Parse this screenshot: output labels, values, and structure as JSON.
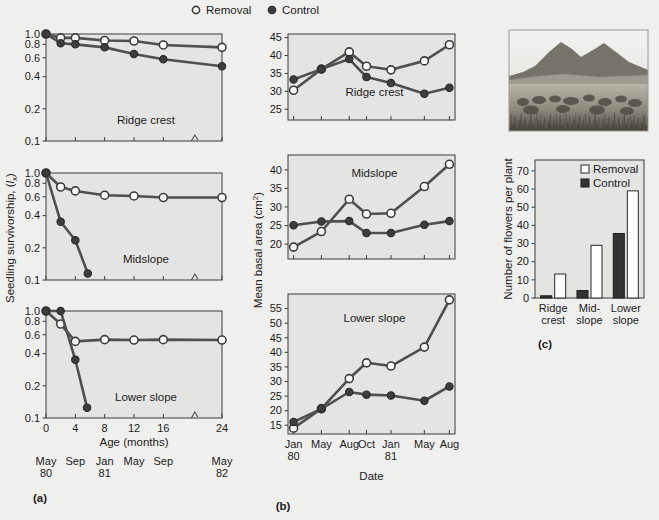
{
  "figure": {
    "legend": [
      {
        "label": "Removal",
        "marker": "open-circle"
      },
      {
        "label": "Control",
        "marker": "filled-circle"
      }
    ],
    "panel_letters": {
      "a": "(a)",
      "b": "(b)",
      "c": "(c)"
    }
  },
  "panel_a": {
    "ylabel": "Seedling survivorship, (lx)",
    "xlabel": "Age (months)",
    "yticks": [
      "1.0",
      "0.8",
      "0.6",
      "0.4",
      "0.2",
      "0.1"
    ],
    "ytickvals": [
      1.0,
      0.8,
      0.6,
      0.4,
      0.2,
      0.1
    ],
    "ylim": [
      0.1,
      1.0
    ],
    "yscale": "log",
    "xticks": [
      "0",
      "4",
      "8",
      "12",
      "16",
      "24"
    ],
    "xtickvals": [
      0,
      4,
      8,
      12,
      16,
      24
    ],
    "xlim": [
      0,
      24
    ],
    "axis_break_at": 20,
    "date_labels": [
      {
        "line1": "May",
        "line2": "80",
        "x": 0
      },
      {
        "line1": "Sep",
        "line2": "",
        "x": 4
      },
      {
        "line1": "Jan",
        "line2": "81",
        "x": 8
      },
      {
        "line1": "May",
        "line2": "",
        "x": 12
      },
      {
        "line1": "Sep",
        "line2": "",
        "x": 16
      },
      {
        "line1": "May",
        "line2": "82",
        "x": 24
      }
    ],
    "subplots": [
      {
        "title": "Ridge crest",
        "series": [
          {
            "name": "Removal",
            "marker": "open-circle",
            "x": [
              0,
              2,
              4,
              8,
              12,
              16,
              24
            ],
            "y": [
              1.0,
              0.92,
              0.92,
              0.87,
              0.86,
              0.79,
              0.75
            ]
          },
          {
            "name": "Control",
            "marker": "filled-circle",
            "x": [
              0,
              2,
              4,
              8,
              12,
              16,
              24
            ],
            "y": [
              1.0,
              0.82,
              0.8,
              0.75,
              0.65,
              0.58,
              0.5
            ]
          }
        ]
      },
      {
        "title": "Midslope",
        "series": [
          {
            "name": "Removal",
            "marker": "open-circle",
            "x": [
              0,
              2,
              4,
              8,
              12,
              16,
              24
            ],
            "y": [
              1.0,
              0.74,
              0.68,
              0.62,
              0.61,
              0.59,
              0.59
            ]
          },
          {
            "name": "Control",
            "marker": "filled-circle",
            "x": [
              0,
              2,
              4,
              5.7
            ],
            "y": [
              1.0,
              0.35,
              0.235,
              0.115
            ]
          }
        ]
      },
      {
        "title": "Lower slope",
        "series": [
          {
            "name": "Removal",
            "marker": "open-circle",
            "x": [
              0,
              2,
              4,
              8,
              12,
              16,
              24
            ],
            "y": [
              1.0,
              0.755,
              0.52,
              0.54,
              0.535,
              0.54,
              0.535
            ]
          },
          {
            "name": "Control",
            "marker": "filled-circle",
            "x": [
              0,
              2,
              4,
              5.6
            ],
            "y": [
              1.0,
              1.0,
              0.35,
              0.125
            ]
          }
        ]
      }
    ]
  },
  "panel_b": {
    "ylabel": "Mean basal area (cm2)",
    "xlabel": "Date",
    "xticks": [
      {
        "line1": "Jan",
        "line2": "80",
        "x": 0
      },
      {
        "line1": "May",
        "line2": "",
        "x": 1
      },
      {
        "line1": "Aug",
        "line2": "",
        "x": 2
      },
      {
        "line1": "Oct",
        "line2": "",
        "x": 2.62
      },
      {
        "line1": "Jan",
        "line2": "81",
        "x": 3.5
      },
      {
        "line1": "May",
        "line2": "",
        "x": 4.7
      },
      {
        "line1": "Aug",
        "line2": "",
        "x": 5.6
      }
    ],
    "xlim": [
      -0.2,
      5.8
    ],
    "subplots": [
      {
        "title": "Ridge crest",
        "ylim": [
          22,
          46
        ],
        "yticks": [
          "25",
          "30",
          "35",
          "40",
          "45"
        ],
        "ytickvals": [
          25,
          30,
          35,
          40,
          45
        ],
        "series": [
          {
            "name": "Removal",
            "marker": "open-circle",
            "x": [
              0,
              1,
              2,
              2.62,
              3.5,
              4.7,
              5.6
            ],
            "y": [
              30.3,
              36.2,
              41.0,
              37.0,
              36.0,
              38.5,
              43.0
            ]
          },
          {
            "name": "Control",
            "marker": "filled-circle",
            "x": [
              0,
              1,
              2,
              2.62,
              3.5,
              4.7,
              5.6
            ],
            "y": [
              33.3,
              36.2,
              39.0,
              34.0,
              32.3,
              29.3,
              31.0
            ]
          }
        ]
      },
      {
        "title": "Midslope",
        "ylim": [
          16,
          44
        ],
        "yticks": [
          "20",
          "25",
          "30",
          "35",
          "40"
        ],
        "ytickvals": [
          20,
          25,
          30,
          35,
          40
        ],
        "series": [
          {
            "name": "Removal",
            "marker": "open-circle",
            "x": [
              0,
              1,
              2,
              2.62,
              3.5,
              4.7,
              5.6
            ],
            "y": [
              19.2,
              23.4,
              32.1,
              28.1,
              28.3,
              35.5,
              41.5
            ]
          },
          {
            "name": "Control",
            "marker": "filled-circle",
            "x": [
              0,
              1,
              2,
              2.62,
              3.5,
              4.7,
              5.6
            ],
            "y": [
              25.1,
              26.1,
              26.2,
              23.0,
              23.0,
              25.2,
              26.2
            ]
          }
        ]
      },
      {
        "title": "Lower slope",
        "ylim": [
          12,
          60
        ],
        "yticks": [
          "15",
          "20",
          "25",
          "30",
          "35",
          "40",
          "45",
          "50",
          "55"
        ],
        "ytickvals": [
          15,
          20,
          25,
          30,
          35,
          40,
          45,
          50,
          55
        ],
        "series": [
          {
            "name": "Removal",
            "marker": "open-circle",
            "x": [
              0,
              1,
              2,
              2.62,
              3.5,
              4.7,
              5.6
            ],
            "y": [
              14.0,
              20.7,
              31.0,
              36.4,
              35.3,
              41.8,
              58.0
            ]
          },
          {
            "name": "Control",
            "marker": "filled-circle",
            "x": [
              0,
              1,
              2,
              2.62,
              3.5,
              4.7,
              5.6
            ],
            "y": [
              16.1,
              20.6,
              26.4,
              25.5,
              25.2,
              23.4,
              28.3
            ]
          }
        ]
      }
    ]
  },
  "panel_c": {
    "ylabel": "Number of flowers per plant",
    "yticks": [
      "0",
      "10",
      "20",
      "30",
      "40",
      "50",
      "60",
      "70"
    ],
    "ytickvals": [
      0,
      10,
      20,
      30,
      40,
      50,
      60,
      70
    ],
    "ylim": [
      0,
      76
    ],
    "legend": [
      {
        "label": "Removal",
        "marker": "open-square"
      },
      {
        "label": "Control",
        "marker": "filled-square"
      }
    ],
    "categories": [
      {
        "line1": "Ridge",
        "line2": "crest"
      },
      {
        "line1": "Mid-",
        "line2": "slope"
      },
      {
        "line1": "Lower",
        "line2": "slope"
      }
    ],
    "series": [
      {
        "name": "Control",
        "style": "filled",
        "values": [
          1.2,
          4.1,
          35.5
        ]
      },
      {
        "name": "Removal",
        "style": "open",
        "values": [
          13.2,
          29.0,
          59.0
        ]
      }
    ]
  },
  "photo": {
    "description": "grassland-hillside-photograph"
  },
  "colors": {
    "plot_background": "#e4e4e2",
    "page_background": "#efefed",
    "line": "#4f4f4f",
    "marker_open_fill": "#ffffff",
    "marker_closed_fill": "#3d3d3d",
    "axis": "#4a4a4a"
  },
  "chart_data": [
    {
      "type": "line",
      "title": "(a) Seedling survivorship by topographic position",
      "xlabel": "Age (months)",
      "ylabel": "Seedling survivorship, (lx)",
      "yscale": "log",
      "ylim": [
        0.1,
        1.0
      ],
      "xlim": [
        0,
        24
      ],
      "x": [
        0,
        2,
        4,
        8,
        12,
        16,
        24
      ],
      "subplots": [
        {
          "panel": "Ridge crest",
          "series": [
            {
              "name": "Removal",
              "x": [
                0,
                2,
                4,
                8,
                12,
                16,
                24
              ],
              "values": [
                1.0,
                0.92,
                0.92,
                0.87,
                0.86,
                0.79,
                0.75
              ]
            },
            {
              "name": "Control",
              "x": [
                0,
                2,
                4,
                8,
                12,
                16,
                24
              ],
              "values": [
                1.0,
                0.82,
                0.8,
                0.75,
                0.65,
                0.58,
                0.5
              ]
            }
          ]
        },
        {
          "panel": "Midslope",
          "series": [
            {
              "name": "Removal",
              "x": [
                0,
                2,
                4,
                8,
                12,
                16,
                24
              ],
              "values": [
                1.0,
                0.74,
                0.68,
                0.62,
                0.61,
                0.59,
                0.59
              ]
            },
            {
              "name": "Control",
              "x": [
                0,
                2,
                4,
                5.7
              ],
              "values": [
                1.0,
                0.35,
                0.235,
                0.115
              ]
            }
          ]
        },
        {
          "panel": "Lower slope",
          "series": [
            {
              "name": "Removal",
              "x": [
                0,
                2,
                4,
                8,
                12,
                16,
                24
              ],
              "values": [
                1.0,
                0.755,
                0.52,
                0.54,
                0.535,
                0.54,
                0.535
              ]
            },
            {
              "name": "Control",
              "x": [
                0,
                2,
                4,
                5.6
              ],
              "values": [
                1.0,
                1.0,
                0.35,
                0.125
              ]
            }
          ]
        }
      ],
      "xtick_labels": [
        "0",
        "4",
        "8",
        "12",
        "16",
        "24"
      ],
      "secondary_xtick_labels": [
        "May 80",
        "Sep",
        "Jan 81",
        "May",
        "Sep",
        "May 82"
      ],
      "legend": [
        "Removal",
        "Control"
      ],
      "grid": false
    },
    {
      "type": "line",
      "title": "(b) Mean basal area by topographic position",
      "xlabel": "Date",
      "ylabel": "Mean basal area (cm2)",
      "categories": [
        "Jan 80",
        "May",
        "Aug",
        "Oct",
        "Jan 81",
        "May",
        "Aug"
      ],
      "subplots": [
        {
          "panel": "Ridge crest",
          "ylim": [
            22,
            46
          ],
          "series": [
            {
              "name": "Removal",
              "values": [
                30.3,
                36.2,
                41.0,
                37.0,
                36.0,
                38.5,
                43.0
              ]
            },
            {
              "name": "Control",
              "values": [
                33.3,
                36.2,
                39.0,
                34.0,
                32.3,
                29.3,
                31.0
              ]
            }
          ]
        },
        {
          "panel": "Midslope",
          "ylim": [
            16,
            44
          ],
          "series": [
            {
              "name": "Removal",
              "values": [
                19.2,
                23.4,
                32.1,
                28.1,
                28.3,
                35.5,
                41.5
              ]
            },
            {
              "name": "Control",
              "values": [
                25.1,
                26.1,
                26.2,
                23.0,
                23.0,
                25.2,
                26.2
              ]
            }
          ]
        },
        {
          "panel": "Lower slope",
          "ylim": [
            12,
            60
          ],
          "series": [
            {
              "name": "Removal",
              "values": [
                14.0,
                20.7,
                31.0,
                36.4,
                35.3,
                41.8,
                58.0
              ]
            },
            {
              "name": "Control",
              "values": [
                16.1,
                20.6,
                26.4,
                25.5,
                25.2,
                23.4,
                28.3
              ]
            }
          ]
        }
      ],
      "legend": [
        "Removal",
        "Control"
      ],
      "grid": false
    },
    {
      "type": "bar",
      "title": "(c) Number of flowers per plant",
      "xlabel": "",
      "ylabel": "Number of flowers per plant",
      "categories": [
        "Ridge crest",
        "Mid-slope",
        "Lower slope"
      ],
      "ylim": [
        0,
        76
      ],
      "series": [
        {
          "name": "Control",
          "values": [
            1.2,
            4.1,
            35.5
          ]
        },
        {
          "name": "Removal",
          "values": [
            13.2,
            29.0,
            59.0
          ]
        }
      ],
      "legend": [
        "Removal",
        "Control"
      ],
      "grid": false
    }
  ]
}
